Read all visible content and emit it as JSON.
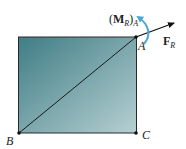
{
  "diagram": {
    "points": {
      "A": {
        "label": "A"
      },
      "B": {
        "label": "B"
      },
      "C": {
        "label": "C"
      }
    },
    "force": {
      "symbol": "F",
      "subscript": "R"
    },
    "moment": {
      "open": "(",
      "symbol": "M",
      "subscript": "R",
      "close": ")",
      "point_subscript": "A"
    },
    "colors": {
      "plate_dark": "#3f7d85",
      "plate_light": "#b6d0d2",
      "moment_arrow": "#4aa6d4",
      "force_arrow": "#111111",
      "outline": "#222222"
    }
  }
}
